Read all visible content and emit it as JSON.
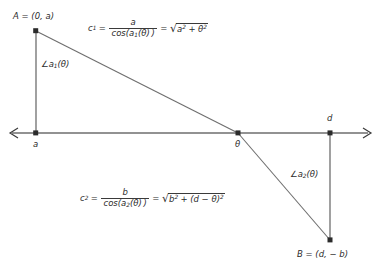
{
  "figure": {
    "type": "geometry-diagram",
    "background_color": "#ffffff",
    "line_color": "#6e6e6e",
    "text_color": "#2b2b2b"
  },
  "points": {
    "A": {
      "label": "A = (0, a)",
      "x": 0,
      "y": "a"
    },
    "B": {
      "label": "B = (d, − b)",
      "x": "d",
      "y": "−b"
    },
    "origin": {
      "label": "a"
    },
    "theta": {
      "label": "θ"
    },
    "d": {
      "label": "d"
    }
  },
  "angles": {
    "upper": {
      "symbol": "∠",
      "name": "a",
      "sub": "1",
      "arg": "(θ)",
      "full": "∠a₁(θ)"
    },
    "lower": {
      "symbol": "∠",
      "name": "a",
      "sub": "2",
      "arg": "(θ)",
      "full": "∠a₂(θ)"
    }
  },
  "formulas": {
    "c1": {
      "lhs": "c",
      "lhs_sub": "1",
      "eq1": "=",
      "numerator": "a",
      "denominator_fn": "cos(",
      "denominator_var": "a",
      "denominator_sub": "1",
      "denominator_arg": "(θ) )",
      "eq2": "=",
      "radical_sign": "√",
      "radicand_a": "a",
      "radicand_a_pow": "2",
      "radicand_plus": "+",
      "radicand_b": "θ",
      "radicand_b_pow": "2",
      "plain": "c₁ = a / cos(a₁(θ)) = √(a² + θ²)"
    },
    "c2": {
      "lhs": "c",
      "lhs_sub": "2",
      "eq1": "=",
      "numerator": "b",
      "denominator_fn": "cos(",
      "denominator_var": "a",
      "denominator_sub": "2",
      "denominator_arg": "(θ) )",
      "eq2": "=",
      "radical_sign": "√",
      "radicand_a": "b",
      "radicand_a_pow": "2",
      "radicand_plus": "+",
      "radicand_b": "(d − θ)",
      "radicand_b_pow": "2",
      "plain": "c₂ = b / cos(a₂(θ)) = √(b² + (d − θ)²)"
    }
  }
}
